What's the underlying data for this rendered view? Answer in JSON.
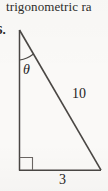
{
  "page": {
    "background_color": "#faf9f7",
    "ink_color": "#3a3734"
  },
  "header": {
    "text": "trigonometric ra"
  },
  "problem": {
    "number_label": "6."
  },
  "figure": {
    "type": "right-triangle",
    "angle_label": "θ",
    "hypotenuse_label": "10",
    "base_label": "3",
    "vertical_leg_label": "",
    "right_angle_marker": true,
    "vertices": {
      "apex": [
        19,
        30
      ],
      "bottom_left": [
        19,
        170
      ],
      "bottom_right": [
        101,
        170
      ]
    },
    "stroke_color": "#4a4744",
    "stroke_width": 1.4
  }
}
